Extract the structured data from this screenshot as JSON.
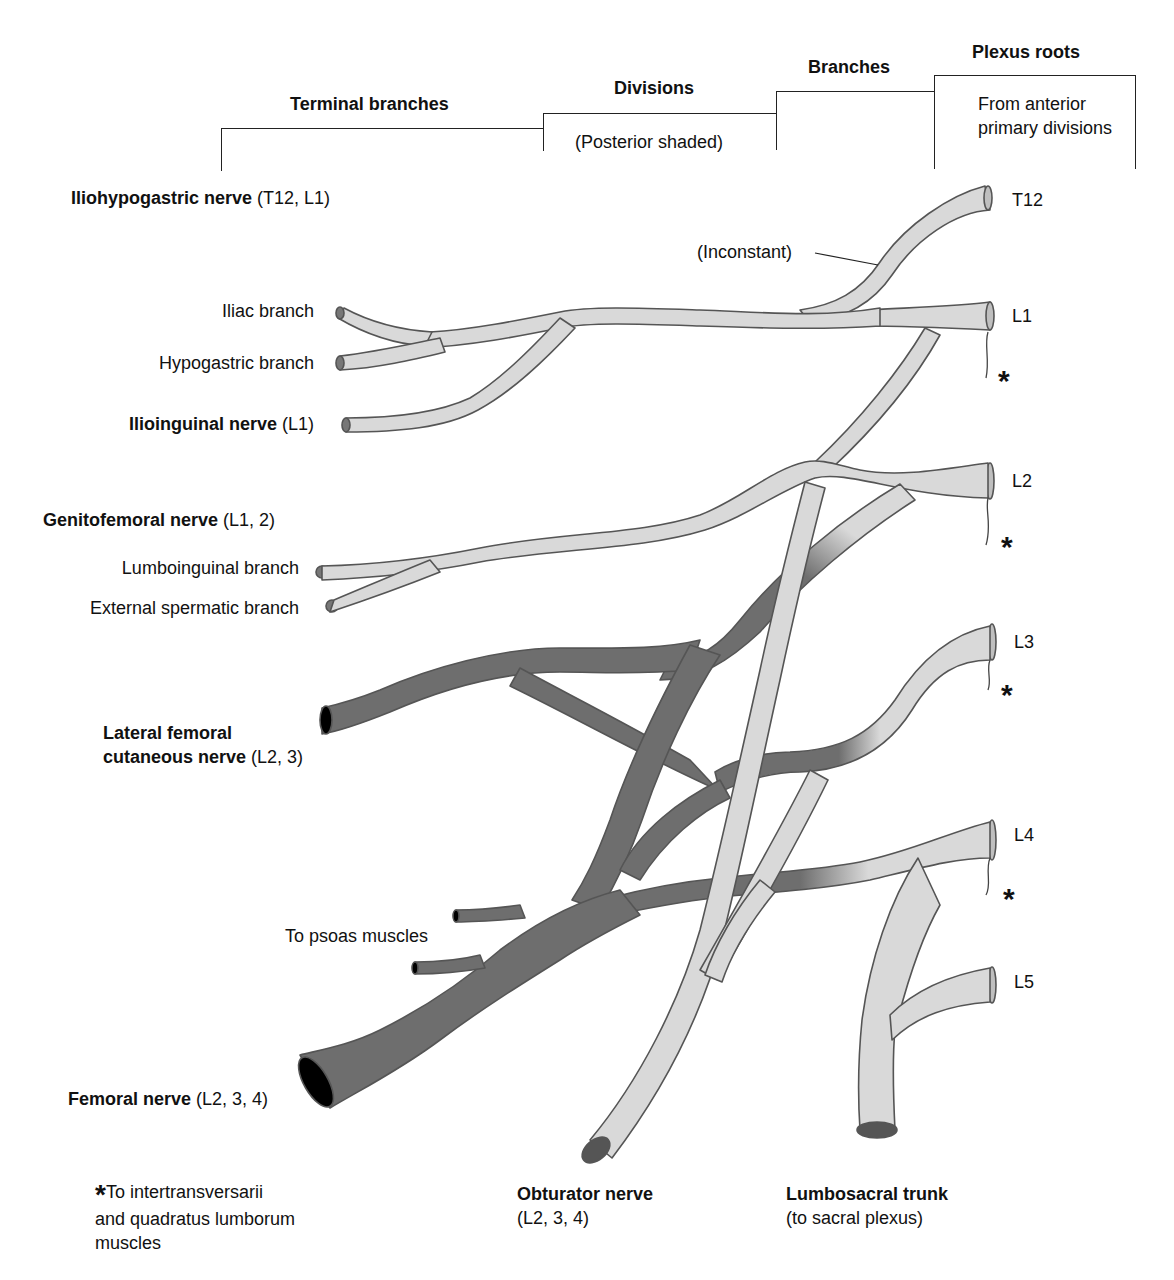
{
  "headers": {
    "terminal_branches": "Terminal branches",
    "divisions": "Divisions",
    "divisions_note": "(Posterior shaded)",
    "branches": "Branches",
    "plexus_roots": "Plexus roots",
    "plexus_roots_note": "From anterior primary divisions"
  },
  "roots": [
    "T12",
    "L1",
    "L2",
    "L3",
    "L4",
    "L5"
  ],
  "inconstant_label": "(Inconstant)",
  "nerves": {
    "iliohypogastric": {
      "name": "Iliohypogastric nerve",
      "segments": "(T12, L1)"
    },
    "iliac_branch": "Iliac branch",
    "hypogastric_branch": "Hypogastric branch",
    "ilioinguinal": {
      "name": "Ilioinguinal nerve",
      "segments": "(L1)"
    },
    "genitofemoral": {
      "name": "Genitofemoral nerve",
      "segments": "(L1, 2)"
    },
    "lumboinguinal_branch": "Lumboinguinal branch",
    "external_spermatic_branch": "External spermatic branch",
    "lateral_femoral_cutaneous": {
      "name_line1": "Lateral femoral",
      "name_line2": "cutaneous nerve",
      "segments": "(L2, 3)"
    },
    "to_psoas": "To psoas muscles",
    "femoral": {
      "name": "Femoral nerve",
      "segments": "(L2, 3, 4)"
    },
    "obturator": {
      "name": "Obturator nerve",
      "segments": "(L2, 3, 4)"
    },
    "lumbosacral_trunk": {
      "name": "Lumbosacral trunk",
      "segments": "(to sacral plexus)"
    }
  },
  "footnote": {
    "symbol": "*",
    "line1": "To intertransversarii",
    "line2": "and quadratus lumborum",
    "line3": "muscles"
  },
  "colors": {
    "anterior_fill": "#d9d9d9",
    "posterior_fill": "#6e6e6e",
    "outline": "#555555",
    "text": "#111111"
  }
}
